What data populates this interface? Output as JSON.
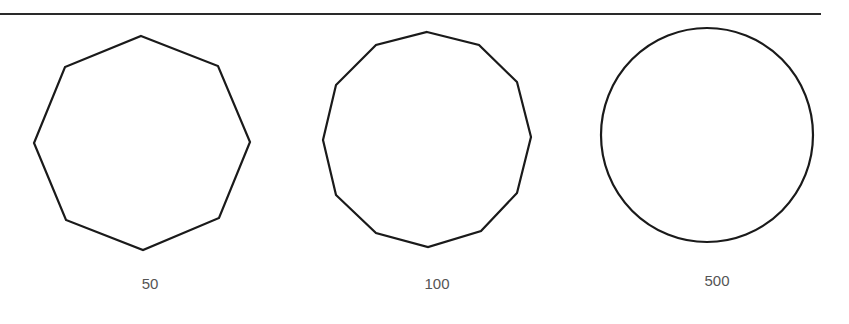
{
  "figure": {
    "panels": [
      {
        "label": "50",
        "shape": "octagon",
        "sides": 8,
        "vertices": [
          [
            141,
            36
          ],
          [
            218,
            66
          ],
          [
            250,
            142
          ],
          [
            219,
            218
          ],
          [
            143,
            250
          ],
          [
            66,
            220
          ],
          [
            34,
            143
          ],
          [
            65,
            67
          ]
        ],
        "label_pos": [
          150,
          275
        ]
      },
      {
        "label": "100",
        "shape": "dodecagon",
        "sides": 12,
        "vertices": [
          [
            427,
            32
          ],
          [
            479,
            45
          ],
          [
            517,
            82
          ],
          [
            531,
            137
          ],
          [
            517,
            193
          ],
          [
            481,
            231
          ],
          [
            428,
            247
          ],
          [
            376,
            233
          ],
          [
            336,
            195
          ],
          [
            323,
            140
          ],
          [
            336,
            85
          ],
          [
            376,
            45
          ]
        ],
        "label_pos": [
          437,
          275
        ]
      },
      {
        "label": "500",
        "shape": "circle",
        "center": [
          707,
          135
        ],
        "rx": 106,
        "ry": 107,
        "label_pos": [
          717,
          272
        ]
      }
    ],
    "colors": {
      "stroke": "#1a1a1a",
      "label": "#555555",
      "rule": "#2a2a2a"
    }
  }
}
